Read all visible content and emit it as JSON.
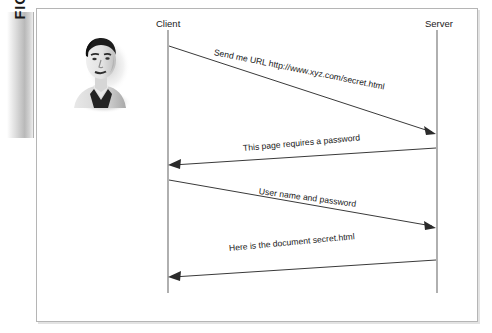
{
  "figure": {
    "label": "FIGURE 7-7"
  },
  "illustration": {
    "name": "person-portrait",
    "description": "grayscale portrait of a man"
  },
  "diagram": {
    "type": "sequence-diagram",
    "actors": [
      {
        "id": "client",
        "label": "Client"
      },
      {
        "id": "server",
        "label": "Server"
      }
    ],
    "messages": [
      {
        "index": 1,
        "label": "Send me URL http://www.xyz.com/secret.html",
        "from": "client",
        "to": "server",
        "direction": "right"
      },
      {
        "index": 2,
        "label": "This page requires a password",
        "from": "server",
        "to": "client",
        "direction": "left"
      },
      {
        "index": 3,
        "label": "User name and password",
        "from": "client",
        "to": "server",
        "direction": "right"
      },
      {
        "index": 4,
        "label": "Here is the document secret.html",
        "from": "server",
        "to": "client",
        "direction": "left"
      }
    ],
    "colors": {
      "line": "#3a3a3a",
      "lifeline": "#6e6e6e",
      "frame": "#b5b5b5",
      "text": "#1a1a1a"
    }
  }
}
